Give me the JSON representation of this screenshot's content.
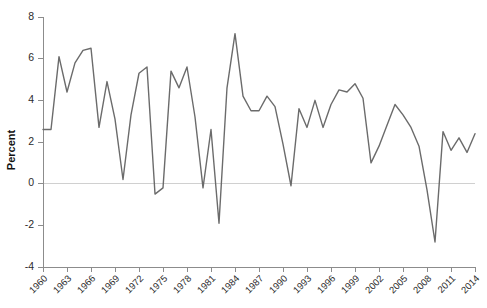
{
  "chart_data": {
    "type": "line",
    "title": "",
    "subtitle": "",
    "xlabel": "",
    "ylabel": "Percent",
    "xlim": [
      1960,
      2014
    ],
    "ylim": [
      -4,
      8
    ],
    "grid": false,
    "legend": null,
    "legend_position": "none",
    "zero_line": true,
    "line_color": "#6b6b6b",
    "axis_color": "#8c8c8c",
    "zero_line_color": "#d0d0d0",
    "y_ticks": [
      -4,
      -2,
      0,
      2,
      4,
      6,
      8
    ],
    "y_tick_labels": [
      "-4",
      "-2",
      "0",
      "2",
      "4",
      "6",
      "8"
    ],
    "x_ticks": [
      1960,
      1963,
      1966,
      1969,
      1972,
      1975,
      1978,
      1981,
      1984,
      1987,
      1990,
      1993,
      1996,
      1999,
      2002,
      2005,
      2008,
      2011,
      2014
    ],
    "x_tick_labels": [
      "1960",
      "1963",
      "1966",
      "1969",
      "1972",
      "1975",
      "1978",
      "1981",
      "1984",
      "1987",
      "1990",
      "1993",
      "1996",
      "1999",
      "2002",
      "2005",
      "2008",
      "2011",
      "2014"
    ],
    "x": [
      1960,
      1961,
      1962,
      1963,
      1964,
      1965,
      1966,
      1967,
      1968,
      1969,
      1970,
      1971,
      1972,
      1973,
      1974,
      1975,
      1976,
      1977,
      1978,
      1979,
      1980,
      1981,
      1982,
      1983,
      1984,
      1985,
      1986,
      1987,
      1988,
      1989,
      1990,
      1991,
      1992,
      1993,
      1994,
      1995,
      1996,
      1997,
      1998,
      1999,
      2000,
      2001,
      2002,
      2003,
      2004,
      2005,
      2006,
      2007,
      2008,
      2009,
      2010,
      2011,
      2012,
      2013,
      2014
    ],
    "values": [
      2.6,
      2.6,
      6.1,
      4.4,
      5.8,
      6.4,
      6.5,
      2.7,
      4.9,
      3.1,
      0.2,
      3.3,
      5.3,
      5.6,
      -0.5,
      -0.2,
      5.4,
      4.6,
      5.6,
      3.2,
      -0.2,
      2.6,
      -1.9,
      4.6,
      7.2,
      4.2,
      3.5,
      3.5,
      4.2,
      3.7,
      1.9,
      -0.1,
      3.6,
      2.7,
      4.0,
      2.7,
      3.8,
      4.5,
      4.4,
      4.8,
      4.1,
      1.0,
      1.8,
      2.8,
      3.8,
      3.3,
      2.7,
      1.8,
      -0.3,
      -2.8,
      2.5,
      1.6,
      2.2,
      1.5,
      2.4
    ],
    "series": [
      {
        "name": "Percent",
        "color": "#6b6b6b",
        "values": [
          2.6,
          2.6,
          6.1,
          4.4,
          5.8,
          6.4,
          6.5,
          2.7,
          4.9,
          3.1,
          0.2,
          3.3,
          5.3,
          5.6,
          -0.5,
          -0.2,
          5.4,
          4.6,
          5.6,
          3.2,
          -0.2,
          2.6,
          -1.9,
          4.6,
          7.2,
          4.2,
          3.5,
          3.5,
          4.2,
          3.7,
          1.9,
          -0.1,
          3.6,
          2.7,
          4.0,
          2.7,
          3.8,
          4.5,
          4.4,
          4.8,
          4.1,
          1.0,
          1.8,
          2.8,
          3.8,
          3.3,
          2.7,
          1.8,
          -0.3,
          -2.8,
          2.5,
          1.6,
          2.2,
          1.5,
          2.4
        ]
      }
    ]
  },
  "axis": {
    "y_title": "Percent"
  }
}
